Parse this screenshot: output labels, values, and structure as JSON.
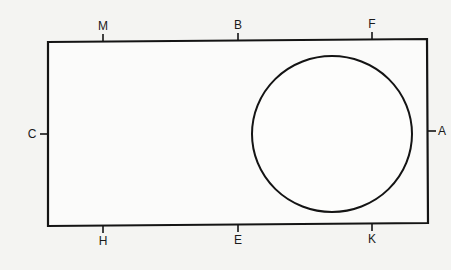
{
  "diagram": {
    "type": "rectangle-with-circle",
    "background": "#f4f4f2",
    "stroke_color": "#141414",
    "rectangle": {
      "top_left": [
        48,
        42
      ],
      "top_right": [
        427,
        39
      ],
      "bottom_right": [
        428,
        223
      ],
      "bottom_left": [
        48,
        226
      ]
    },
    "circle": {
      "cx": 332,
      "cy": 134,
      "rx": 80,
      "ry": 78
    },
    "labels": [
      {
        "id": "M",
        "text": "M",
        "side": "top",
        "x": 103
      },
      {
        "id": "B",
        "text": "B",
        "side": "top",
        "x": 238
      },
      {
        "id": "F",
        "text": "F",
        "side": "top",
        "x": 372
      },
      {
        "id": "C",
        "text": "C",
        "side": "left",
        "y": 134
      },
      {
        "id": "A",
        "text": "A",
        "side": "right",
        "y": 131
      },
      {
        "id": "H",
        "text": "H",
        "side": "bottom",
        "x": 103
      },
      {
        "id": "E",
        "text": "E",
        "side": "bottom",
        "x": 238
      },
      {
        "id": "K",
        "text": "K",
        "side": "bottom",
        "x": 372
      }
    ]
  }
}
